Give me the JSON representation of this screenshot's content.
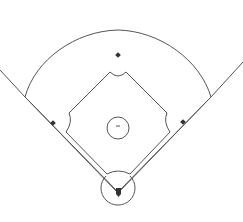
{
  "diagram": {
    "type": "baseball-field",
    "title": "",
    "colors": {
      "background": "#ffffff",
      "line": "#555555",
      "base": "#333333"
    },
    "elements": [
      {
        "name": "foul-line-left"
      },
      {
        "name": "foul-line-right"
      },
      {
        "name": "outfield-arc"
      },
      {
        "name": "infield-diamond"
      },
      {
        "name": "pitchers-mound"
      },
      {
        "name": "pitchers-rubber"
      },
      {
        "name": "home-plate-circle"
      },
      {
        "name": "home-plate"
      },
      {
        "name": "first-base"
      },
      {
        "name": "second-base"
      },
      {
        "name": "third-base"
      }
    ]
  }
}
